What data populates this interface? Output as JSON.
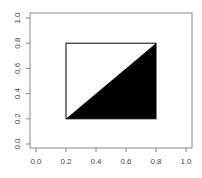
{
  "chart_data": {
    "type": "polygon",
    "title": "",
    "xlabel": "",
    "ylabel": "",
    "xlim": [
      0,
      1
    ],
    "ylim": [
      0,
      1
    ],
    "grid": false,
    "legend": null,
    "x_ticks": [
      "0.0",
      "0.2",
      "0.4",
      "0.6",
      "0.8",
      "1.0"
    ],
    "y_ticks": [
      "0.0",
      "0.2",
      "0.4",
      "0.6",
      "0.8",
      "1.0"
    ],
    "shapes": [
      {
        "name": "rectangle",
        "fill": "none",
        "stroke": "#000000",
        "x0": 0.2,
        "y0": 0.2,
        "x1": 0.8,
        "y1": 0.8
      },
      {
        "name": "triangle",
        "fill": "#000000",
        "points": [
          [
            0.2,
            0.2
          ],
          [
            0.8,
            0.2
          ],
          [
            0.8,
            0.8
          ]
        ]
      }
    ]
  },
  "colors": {
    "axis": "#888888",
    "shape_stroke": "#000000",
    "fill": "#000000"
  }
}
